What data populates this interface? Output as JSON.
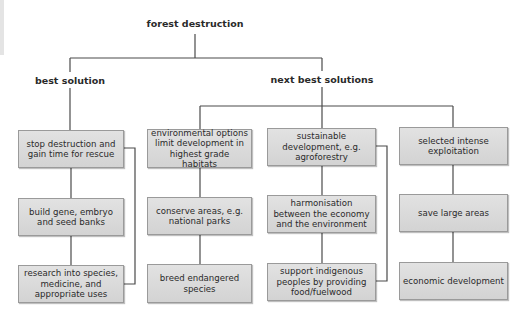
{
  "diagram": {
    "root": "forest destruction",
    "branches": [
      {
        "label": "best solution",
        "columns": [
          [
            "stop destruction and gain time for rescue",
            "build gene, embryo and seed banks",
            "research into species, medicine, and appropriate uses"
          ]
        ]
      },
      {
        "label": "next best solutions",
        "columns": [
          [
            "environmental options limit development in highest grade habitats",
            "conserve areas, e.g. national parks",
            "breed endangered species"
          ],
          [
            "sustainable development, e.g. agroforestry",
            "harmonisation between the economy and the environment",
            "support indigenous peoples by providing food/fuelwood"
          ],
          [
            "selected intense exploitation",
            "save large areas",
            "economic development"
          ]
        ]
      }
    ]
  }
}
